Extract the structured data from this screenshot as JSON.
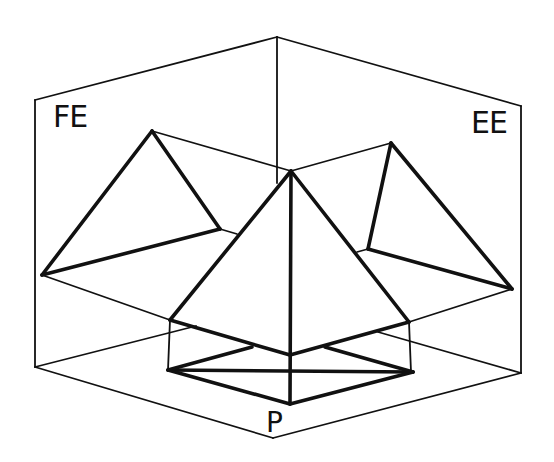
{
  "diagram": {
    "type": "orthographic-projection-of-pyramid",
    "labels": {
      "front_elevation": "FE",
      "end_elevation": "EE",
      "plan": "P"
    },
    "colors": {
      "stroke": "#111111",
      "background": "#ffffff"
    },
    "box": {
      "top": [
        277,
        37
      ],
      "fe_top_left": [
        35,
        100
      ],
      "fe_bottom_left": [
        35,
        367
      ],
      "ee_top_right": [
        521,
        106
      ],
      "ee_bottom_right": [
        521,
        373
      ],
      "bottom": [
        273,
        438
      ],
      "back_vertical_end": [
        277,
        183
      ]
    },
    "pyramid": {
      "apex": [
        291,
        171
      ],
      "base_left": [
        170,
        320
      ],
      "base_front": [
        290,
        355
      ],
      "base_right": [
        409,
        322
      ],
      "axis_bottom": [
        290,
        404
      ]
    },
    "plan": {
      "left": [
        168,
        370
      ],
      "right": [
        413,
        372
      ],
      "front": [
        290,
        404
      ],
      "back_left_visible": [
        252,
        347
      ],
      "back_right_visible": [
        325,
        347
      ]
    },
    "fe_triangle": {
      "apex": [
        152,
        131
      ],
      "left": [
        42,
        275
      ],
      "right": [
        220,
        229
      ]
    },
    "ee_triangle": {
      "apex": [
        391,
        143
      ],
      "left": [
        368,
        249
      ],
      "right": [
        512,
        289
      ]
    }
  }
}
